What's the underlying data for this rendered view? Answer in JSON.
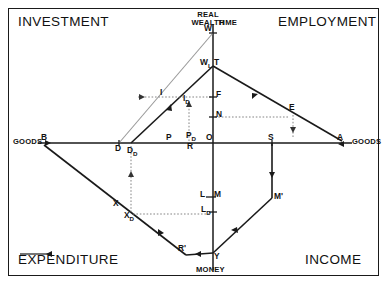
{
  "diagram": {
    "title_present": false,
    "quadrant_labels": [
      {
        "id": "investment",
        "text": "INVESTMENT"
      },
      {
        "id": "employment",
        "text": "EMPLOYMENT"
      },
      {
        "id": "expenditure",
        "text": "EXPENDITURE"
      },
      {
        "id": "income",
        "text": "INCOME"
      }
    ],
    "axis_labels": [
      {
        "id": "real-wealth",
        "text": "REAL\nWEALTH"
      },
      {
        "id": "time",
        "text": "TIME"
      },
      {
        "id": "goods-left",
        "text": "GOODS"
      },
      {
        "id": "goods-right",
        "text": "GOODS"
      },
      {
        "id": "money",
        "text": "MONEY"
      }
    ],
    "axis_label_lines": {
      "real_wealth_1": "REAL",
      "real_wealth_2": "WEALTH",
      "time": "TIME",
      "goods_left": "GOODS",
      "goods_right": "GOODS",
      "money": "MONEY"
    },
    "point_labels": [
      {
        "id": "W-top",
        "base": "W",
        "sub": ""
      },
      {
        "id": "W-lower",
        "base": "W",
        "sub": "L"
      },
      {
        "id": "T",
        "base": "T",
        "sub": ""
      },
      {
        "id": "I",
        "base": "I",
        "sub": ""
      },
      {
        "id": "I-D",
        "base": "I",
        "sub": "D"
      },
      {
        "id": "F",
        "base": "F",
        "sub": ""
      },
      {
        "id": "N",
        "base": "N",
        "sub": ""
      },
      {
        "id": "E",
        "base": "E",
        "sub": ""
      },
      {
        "id": "A",
        "base": "A",
        "sub": ""
      },
      {
        "id": "B",
        "base": "B",
        "sub": ""
      },
      {
        "id": "D",
        "base": "D",
        "sub": ""
      },
      {
        "id": "D-D",
        "base": "D",
        "sub": "D"
      },
      {
        "id": "P",
        "base": "P",
        "sub": ""
      },
      {
        "id": "P-D",
        "base": "P",
        "sub": "D"
      },
      {
        "id": "R",
        "base": "R",
        "sub": ""
      },
      {
        "id": "O",
        "base": "O",
        "sub": ""
      },
      {
        "id": "S",
        "base": "S",
        "sub": ""
      },
      {
        "id": "X",
        "base": "X",
        "sub": ""
      },
      {
        "id": "X-D",
        "base": "X",
        "sub": "D"
      },
      {
        "id": "L",
        "base": "L",
        "sub": ""
      },
      {
        "id": "M",
        "base": "M",
        "sub": ""
      },
      {
        "id": "L-D",
        "base": "L",
        "sub": "D"
      },
      {
        "id": "M-prime",
        "base": "M'",
        "sub": ""
      },
      {
        "id": "R-prime",
        "base": "R'",
        "sub": ""
      },
      {
        "id": "Y",
        "base": "Y",
        "sub": ""
      }
    ],
    "labels": {
      "W_top": "W",
      "W_lower": "W",
      "W_lower_sub": "L",
      "T": "T",
      "I": "I",
      "I_base": "I",
      "I_sub": "D",
      "F": "F",
      "N": "N",
      "E": "E",
      "A": "A",
      "B": "B",
      "D": "D",
      "D_base": "D",
      "D_sub": "D",
      "P": "P",
      "P_base": "P",
      "P_sub": "D",
      "R": "R",
      "O": "O",
      "S": "S",
      "X": "X",
      "X_base": "X",
      "X_sub": "D",
      "L": "L",
      "M": "M",
      "L_base": "L",
      "L_sub": "D",
      "M_prime": "M'",
      "R_prime": "R'",
      "Y": "Y"
    },
    "colors": {
      "ink": "#111111",
      "line": "#1a1a1a",
      "background": "#ffffff",
      "dotted": "#555555",
      "faint": "#888888"
    },
    "geometry": {
      "origin": {
        "x": 213,
        "y": 143
      },
      "vertical_axis": {
        "x": 213,
        "top": 24,
        "bottom": 270
      },
      "horizontal_axis": {
        "y": 143,
        "left": 38,
        "right": 352
      },
      "points": {
        "W_top": {
          "x": 213,
          "y": 33
        },
        "W_lower": {
          "x": 213,
          "y": 66
        },
        "A": {
          "x": 342,
          "y": 141
        },
        "B": {
          "x": 44,
          "y": 145
        },
        "D": {
          "x": 119,
          "y": 143
        },
        "D_D": {
          "x": 131,
          "y": 143
        },
        "S": {
          "x": 272,
          "y": 143
        },
        "M_prime": {
          "x": 272,
          "y": 198
        },
        "R_prime": {
          "x": 186,
          "y": 255
        },
        "Y": {
          "x": 213,
          "y": 253
        },
        "F": {
          "x": 213,
          "y": 97
        },
        "N": {
          "x": 213,
          "y": 117
        },
        "L": {
          "x": 213,
          "y": 198
        },
        "L_D": {
          "x": 213,
          "y": 215
        },
        "E": {
          "x": 293,
          "y": 112
        }
      }
    }
  }
}
